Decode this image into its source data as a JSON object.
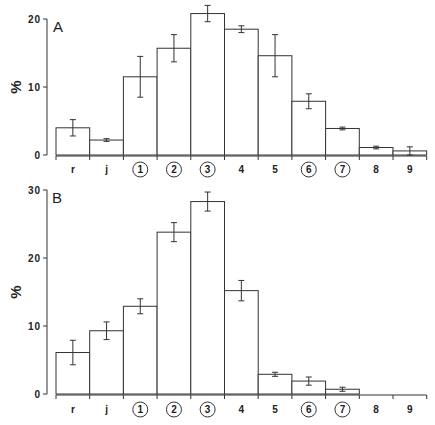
{
  "chart_data": [
    {
      "type": "bar",
      "panel": "A",
      "title": "A",
      "xlabel": "",
      "ylabel": "%",
      "ylim": [
        0,
        20
      ],
      "yticks": [
        0,
        10,
        20
      ],
      "grid": false,
      "error_bars": true,
      "categories": [
        "r",
        "j",
        "1",
        "2",
        "3",
        "4",
        "5",
        "6",
        "7",
        "8",
        "9"
      ],
      "circled_categories": [
        "1",
        "2",
        "3",
        "6",
        "7"
      ],
      "values": [
        4.0,
        2.2,
        11.5,
        15.7,
        20.8,
        18.5,
        14.6,
        7.9,
        3.9,
        1.1,
        0.6
      ],
      "errors": [
        1.2,
        0.2,
        3.0,
        2.0,
        1.2,
        0.5,
        3.1,
        1.1,
        0.2,
        0.2,
        0.6
      ]
    },
    {
      "type": "bar",
      "panel": "B",
      "title": "B",
      "xlabel": "",
      "ylabel": "%",
      "ylim": [
        0,
        30
      ],
      "yticks": [
        0,
        10,
        20,
        30
      ],
      "grid": false,
      "error_bars": true,
      "categories": [
        "r",
        "j",
        "1",
        "2",
        "3",
        "4",
        "5",
        "6",
        "7",
        "8",
        "9"
      ],
      "circled_categories": [
        "1",
        "2",
        "3",
        "6",
        "7"
      ],
      "values": [
        6.1,
        9.3,
        12.9,
        23.8,
        28.3,
        15.2,
        2.9,
        1.9,
        0.7,
        0,
        0
      ],
      "errors": [
        1.8,
        1.3,
        1.1,
        1.4,
        1.4,
        1.5,
        0.3,
        0.6,
        0.3,
        0,
        0
      ]
    }
  ],
  "panels": {
    "A": {
      "letter": "A",
      "ylabel": "%"
    },
    "B": {
      "letter": "B",
      "ylabel": "%"
    }
  },
  "colors": {
    "stroke": "#333333",
    "fill": "#ffffff",
    "text": "#222222"
  }
}
